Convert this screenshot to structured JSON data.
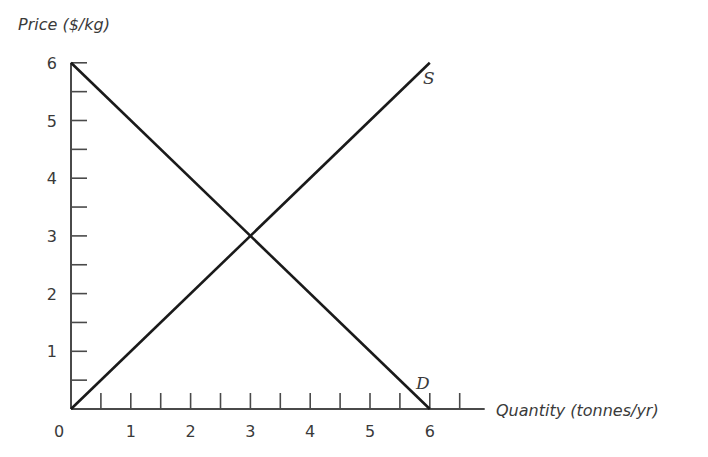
{
  "chart_data": {
    "type": "line",
    "title": "",
    "xlabel": "Quantity (tonnes/yr)",
    "ylabel": "Price ($/kg)",
    "xlim": [
      0,
      6.5
    ],
    "ylim": [
      0,
      6
    ],
    "x_ticks": [
      "0",
      "1",
      "2",
      "3",
      "4",
      "5",
      "6"
    ],
    "y_ticks": [
      "1",
      "2",
      "3",
      "4",
      "5",
      "6"
    ],
    "x_minor_step": 0.5,
    "y_minor_step": 0.5,
    "grid": false,
    "legend": "none",
    "series": [
      {
        "name": "S",
        "x": [
          0,
          6
        ],
        "y": [
          0,
          6
        ]
      },
      {
        "name": "D",
        "x": [
          0,
          6
        ],
        "y": [
          6,
          0
        ]
      }
    ],
    "annotations": [
      {
        "text": "S",
        "x": 6,
        "y": 6
      },
      {
        "text": "D",
        "x": 6,
        "y": 0
      }
    ],
    "colors": {
      "line": "#1a1a1a",
      "axis": "#4a4a4a",
      "text": "#3a3a3a"
    }
  },
  "labels": {
    "ylabel": "Price ($/kg)",
    "xlabel": "Quantity (tonnes/yr)",
    "origin": "0",
    "supply": "S",
    "demand": "D"
  }
}
